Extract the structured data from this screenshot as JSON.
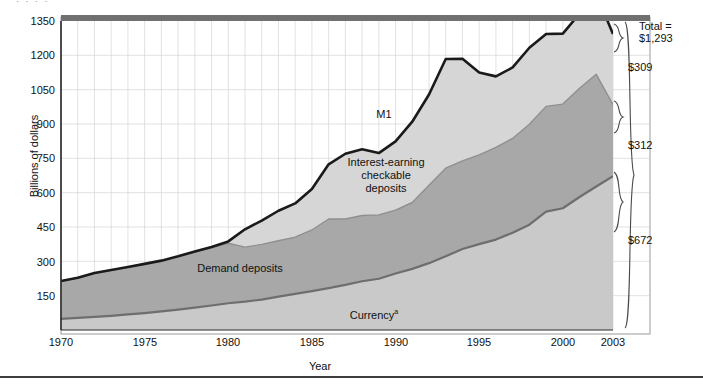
{
  "figure": {
    "top_fragment": "· · · ·",
    "ylabel": "Billions of dollars",
    "xlabel": "Year"
  },
  "yticks": [
    "1350",
    "1200",
    "1050",
    "900",
    "750",
    "600",
    "450",
    "300",
    "150"
  ],
  "xticks": [
    "1970",
    "1975",
    "1980",
    "1985",
    "1990",
    "1995",
    "2000",
    "2003"
  ],
  "series_labels": {
    "m1": "M1",
    "iecd": "Interest-earning\ncheckable\ndeposits",
    "demand": "Demand deposits",
    "currency": "Currency"
  },
  "currency_footnote_marker": "a",
  "brackets": {
    "total": "Total =\n$1,293",
    "iecd": "$309",
    "demand": "$312",
    "currency": "$672"
  },
  "colors": {
    "m1_line": "#1a1a1a",
    "iecd_fill": "#d6d6d6",
    "demand_fill": "#a8a8a8",
    "currency_fill": "#c9c9c9",
    "currency_line": "#6e6e6e",
    "grid": "#cfcfcf",
    "axis": "#2b2b2b",
    "top_band": "#707070",
    "frame": "#9a9a9a"
  },
  "chart_data": {
    "type": "area",
    "title": "",
    "subtitle": "",
    "xlabel": "Year",
    "ylabel": "Billions of dollars",
    "ylim": [
      0,
      1350
    ],
    "xlim": [
      1970,
      2003
    ],
    "grid": true,
    "legend_position": "in-plot labels",
    "stacked": true,
    "x": [
      1970,
      1971,
      1972,
      1973,
      1974,
      1975,
      1976,
      1977,
      1978,
      1979,
      1980,
      1981,
      1982,
      1983,
      1984,
      1985,
      1986,
      1987,
      1988,
      1989,
      1990,
      1991,
      1992,
      1993,
      1994,
      1995,
      1996,
      1997,
      1998,
      1999,
      2000,
      2001,
      2002,
      2003
    ],
    "series": [
      {
        "name": "Currency",
        "note": "bottom band of the stack",
        "values": [
          49,
          53,
          57,
          62,
          68,
          74,
          81,
          89,
          98,
          107,
          117,
          124,
          133,
          146,
          158,
          170,
          183,
          197,
          213,
          224,
          247,
          267,
          292,
          322,
          354,
          375,
          395,
          425,
          460,
          517,
          532,
          581,
          627,
          672
        ]
      },
      {
        "name": "Demand deposits",
        "note": "middle band of the stack",
        "values": [
          165,
          175,
          191,
          200,
          207,
          215,
          222,
          232,
          243,
          252,
          262,
          238,
          241,
          244,
          248,
          267,
          302,
          288,
          287,
          279,
          277,
          290,
          340,
          385,
          385,
          390,
          403,
          412,
          439,
          460,
          455,
          475,
          490,
          312
        ]
      },
      {
        "name": "Interest-earning checkable deposits",
        "note": "top band of the stack",
        "values": [
          0,
          0,
          0,
          0,
          0,
          0,
          0,
          1,
          2,
          4,
          8,
          78,
          104,
          131,
          147,
          179,
          239,
          285,
          290,
          270,
          300,
          353,
          397,
          477,
          446,
          360,
          310,
          310,
          334,
          316,
          308,
          326,
          352,
          309
        ]
      }
    ],
    "total_series": {
      "name": "M1",
      "values": [
        214,
        228,
        249,
        262,
        275,
        289,
        303,
        322,
        343,
        363,
        387,
        440,
        478,
        521,
        553,
        616,
        724,
        770,
        790,
        773,
        824,
        910,
        1029,
        1184,
        1185,
        1125,
        1108,
        1147,
        1233,
        1293,
        1295,
        1382,
        1469,
        1293
      ]
    },
    "annotations": [
      {
        "text": "Total = $1,293",
        "kind": "right-bracket",
        "value": 1293
      },
      {
        "text": "$309",
        "kind": "right-bracket",
        "series": "Interest-earning checkable deposits"
      },
      {
        "text": "$312",
        "kind": "right-bracket",
        "series": "Demand deposits"
      },
      {
        "text": "$672",
        "kind": "right-bracket",
        "series": "Currency"
      }
    ]
  }
}
